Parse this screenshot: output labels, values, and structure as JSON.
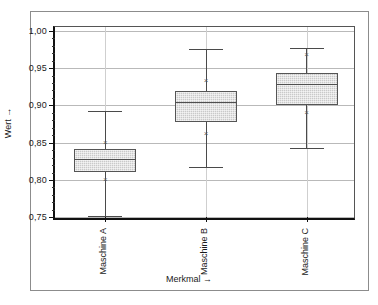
{
  "chart_data": {
    "type": "box",
    "title": "",
    "xlabel": "Merkmal →",
    "ylabel": "Wert →",
    "categories": [
      "Maschine A",
      "Maschine B",
      "Maschine C"
    ],
    "ylim": [
      0.745,
      1.005
    ],
    "ytick_labels": [
      "1,00",
      "0,95",
      "0,90",
      "0,85",
      "0,80",
      "0,75"
    ],
    "ytick_values": [
      1.0,
      0.95,
      0.9,
      0.85,
      0.8,
      0.75
    ],
    "yminor_step": 0.01,
    "grid": "horizontal-and-vertical",
    "legend": "none",
    "boxes": [
      {
        "name": "Maschine A",
        "whisker_low": 0.752,
        "q1": 0.81,
        "median": 0.828,
        "q3": 0.841,
        "whisker_high": 0.893,
        "markers": [
          0.8,
          0.85
        ]
      },
      {
        "name": "Maschine B",
        "whisker_low": 0.817,
        "q1": 0.878,
        "median": 0.905,
        "q3": 0.919,
        "whisker_high": 0.976,
        "markers": [
          0.862,
          0.932
        ]
      },
      {
        "name": "Maschine C",
        "whisker_low": 0.843,
        "q1": 0.901,
        "median": 0.928,
        "q3": 0.944,
        "whisker_high": 0.977,
        "markers": [
          0.89,
          0.968
        ]
      }
    ]
  },
  "colors": {
    "box_fill": "#c9c9c9",
    "box_edge": "#555555",
    "whisker": "#4a4a4a",
    "grid": "#b9b9b9",
    "axis": "#111111",
    "frame": "#8c8c8c",
    "background": "#ffffff",
    "text": "#1a1a1a"
  },
  "marker_glyph": "×"
}
